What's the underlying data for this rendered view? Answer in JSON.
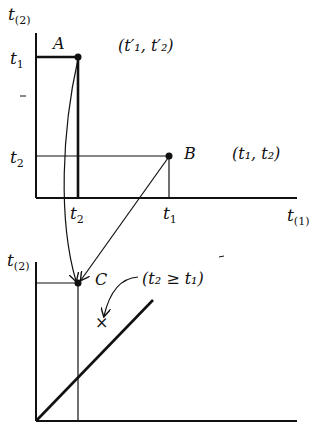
{
  "diagram": {
    "colors": {
      "ink": "#111111",
      "background": "#ffffff"
    },
    "top_panel": {
      "y_axis_label": {
        "main": "t",
        "sub": "(2)"
      },
      "x_axis_label": {
        "main": "t",
        "sub": "(1)"
      },
      "y_ticks": [
        {
          "main": "t",
          "sub": "1"
        },
        {
          "main": "t",
          "sub": "2"
        }
      ],
      "x_ticks": [
        {
          "main": "t",
          "sub": "2"
        },
        {
          "main": "t",
          "sub": "1"
        }
      ],
      "point_A": {
        "label": "A",
        "coords": "(t′₁, t′₂)"
      },
      "point_B": {
        "label": "B",
        "coords": "(t₁, t₂)"
      }
    },
    "bottom_panel": {
      "y_axis_label": {
        "main": "t",
        "sub": "(2)"
      },
      "point_C": {
        "label": "C"
      },
      "region_note": "(t₂ ≥ t₁)",
      "marker": "×"
    }
  }
}
